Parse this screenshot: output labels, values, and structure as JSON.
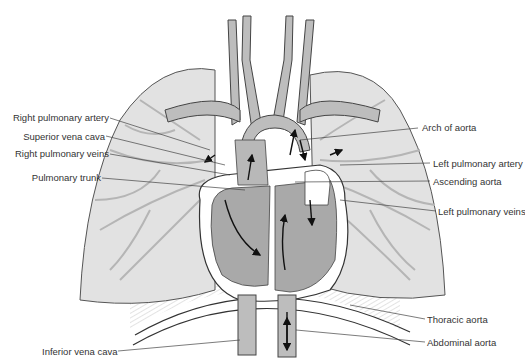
{
  "diagram": {
    "type": "anatomical illustration",
    "colors": {
      "lung_fill": "#e2e2e2",
      "vessel_fill": "#bdbdbd",
      "heart_fill": "#a9a9a9",
      "outline": "#555555",
      "leader_line": "#444444",
      "text": "#333333"
    },
    "labels_left": [
      {
        "id": "right-pulmonary-artery",
        "text": "Right pulmonary artery"
      },
      {
        "id": "superior-vena-cava",
        "text": "Superior vena cava"
      },
      {
        "id": "right-pulmonary-veins",
        "text": "Right pulmonary veins"
      },
      {
        "id": "pulmonary-trunk",
        "text": "Pulmonary trunk"
      },
      {
        "id": "inferior-vena-cava",
        "text": "Inferior vena cava"
      }
    ],
    "labels_right": [
      {
        "id": "arch-of-aorta",
        "text": "Arch of aorta"
      },
      {
        "id": "left-pulmonary-artery",
        "text": "Left pulmonary artery"
      },
      {
        "id": "ascending-aorta",
        "text": "Ascending aorta"
      },
      {
        "id": "left-pulmonary-veins",
        "text": "Left pulmonary veins"
      },
      {
        "id": "thoracic-aorta",
        "text": "Thoracic aorta"
      },
      {
        "id": "abdominal-aorta",
        "text": "Abdominal aorta"
      }
    ]
  }
}
